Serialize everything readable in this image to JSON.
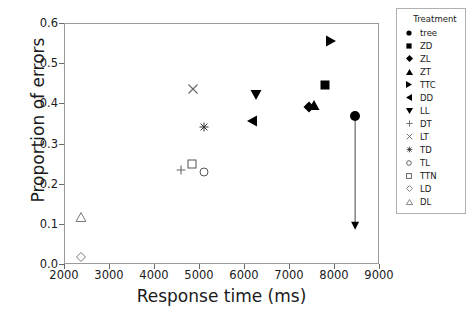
{
  "chart_data": {
    "type": "scatter",
    "title": "",
    "xlabel": "Response time (ms)",
    "ylabel": "Proportion of errors",
    "xlim": [
      2000,
      9000
    ],
    "ylim": [
      0.0,
      0.6
    ],
    "xticks": [
      2000,
      3000,
      4000,
      5000,
      6000,
      7000,
      8000,
      9000
    ],
    "xtick_labels": [
      "2000",
      "3000",
      "4000",
      "5000",
      "6000",
      "7000",
      "8000",
      "9000"
    ],
    "yticks": [
      0.0,
      0.1,
      0.2,
      0.3,
      0.4,
      0.5,
      0.6
    ],
    "ytick_labels": [
      "0.0",
      "0.1",
      "0.2",
      "0.3",
      "0.4",
      "0.5",
      "0.6"
    ],
    "grid": false,
    "legend_position": "right-outside",
    "legend_title": "Treatment",
    "points": [
      {
        "label": "tree",
        "marker": "circle-filled",
        "x": 8470,
        "y": 0.368
      },
      {
        "label": "ZD",
        "marker": "square-filled",
        "x": 7800,
        "y": 0.445
      },
      {
        "label": "ZL",
        "marker": "diamond-filled",
        "x": 7450,
        "y": 0.39
      },
      {
        "label": "ZT",
        "marker": "triangle-up-filled",
        "x": 7560,
        "y": 0.395
      },
      {
        "label": "TTC",
        "marker": "triangle-right-filled",
        "x": 7940,
        "y": 0.555
      },
      {
        "label": "DD",
        "marker": "triangle-left-filled",
        "x": 6170,
        "y": 0.357
      },
      {
        "label": "LL",
        "marker": "triangle-down-filled",
        "x": 6260,
        "y": 0.42
      },
      {
        "label": "DT",
        "marker": "plus",
        "x": 4600,
        "y": 0.235
      },
      {
        "label": "LT",
        "marker": "cross",
        "x": 4870,
        "y": 0.435
      },
      {
        "label": "TD",
        "marker": "asterisk",
        "x": 5110,
        "y": 0.34
      },
      {
        "label": "TL",
        "marker": "circle-open",
        "x": 5110,
        "y": 0.228
      },
      {
        "label": "TTN",
        "marker": "square-open",
        "x": 4850,
        "y": 0.25
      },
      {
        "label": "LD",
        "marker": "diamond-open",
        "x": 2380,
        "y": 0.018
      },
      {
        "label": "DL",
        "marker": "triangle-up-open",
        "x": 2380,
        "y": 0.118
      }
    ],
    "annotations": [
      {
        "type": "arrow",
        "description": "downward arrow from tree point",
        "x": 8470,
        "y_start": 0.368,
        "y_end": 0.085
      }
    ]
  },
  "legend": {
    "title": "Treatment",
    "entries": [
      {
        "label": "tree",
        "marker": "circle-filled"
      },
      {
        "label": "ZD",
        "marker": "square-filled"
      },
      {
        "label": "ZL",
        "marker": "diamond-filled"
      },
      {
        "label": "ZT",
        "marker": "triangle-up-filled"
      },
      {
        "label": "TTC",
        "marker": "triangle-right-filled"
      },
      {
        "label": "DD",
        "marker": "triangle-left-filled"
      },
      {
        "label": "LL",
        "marker": "triangle-down-filled"
      },
      {
        "label": "DT",
        "marker": "plus"
      },
      {
        "label": "LT",
        "marker": "cross"
      },
      {
        "label": "TD",
        "marker": "asterisk"
      },
      {
        "label": "TL",
        "marker": "circle-open"
      },
      {
        "label": "TTN",
        "marker": "square-open"
      },
      {
        "label": "LD",
        "marker": "diamond-open"
      },
      {
        "label": "DL",
        "marker": "triangle-up-open"
      }
    ]
  },
  "colors": {
    "marker": "#000000",
    "axis": "#9a9a9a",
    "text": "#1a1a1a",
    "background": "#ffffff"
  }
}
